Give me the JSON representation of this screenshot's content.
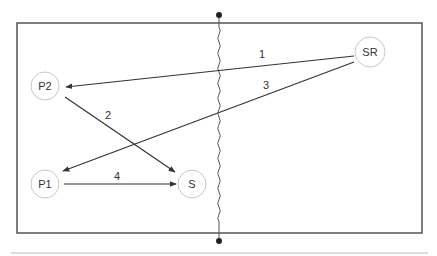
{
  "diagram": {
    "colors": {
      "frame": "#555555",
      "edge": "#333333",
      "node_stroke": "#c8c8c8",
      "text": "#333333",
      "footer_rule": "#bbbbbb",
      "wall": "#555555"
    },
    "nodes": [
      {
        "id": "SR",
        "label": "SR",
        "cx": 370,
        "cy": 52,
        "r": 15
      },
      {
        "id": "P2",
        "label": "P2",
        "cx": 45,
        "cy": 86,
        "r": 14
      },
      {
        "id": "P1",
        "label": "P1",
        "cx": 45,
        "cy": 184,
        "r": 14
      },
      {
        "id": "S",
        "label": "S",
        "cx": 192,
        "cy": 184,
        "r": 14
      }
    ],
    "edges": [
      {
        "label": "1",
        "from": "SR",
        "to": "P2",
        "x1": 354,
        "y1": 56,
        "x2": 66,
        "y2": 87,
        "lx": 262,
        "ly": 58
      },
      {
        "label": "2",
        "from": "P2",
        "to": "S",
        "x1": 65,
        "y1": 97,
        "x2": 175,
        "y2": 172,
        "lx": 108,
        "ly": 119
      },
      {
        "label": "3",
        "from": "SR",
        "to": "P1",
        "x1": 354,
        "y1": 62,
        "x2": 63,
        "y2": 171,
        "lx": 266,
        "ly": 89
      },
      {
        "label": "4",
        "from": "P1",
        "to": "S",
        "x1": 64,
        "y1": 184,
        "x2": 176,
        "y2": 184,
        "lx": 117,
        "ly": 180
      }
    ],
    "frame": {
      "x": 17,
      "y": 23,
      "width": 405,
      "height": 210
    },
    "divider": {
      "x": 219,
      "top_dot_y": 15,
      "bottom_dot_y": 241,
      "label": "wavy-partition"
    },
    "footer_rule": {
      "x1": 11,
      "x2": 428,
      "y": 253
    }
  }
}
